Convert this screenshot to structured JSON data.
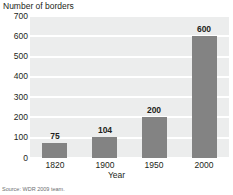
{
  "chart_data": {
    "type": "bar",
    "title": "",
    "ylabel": "Number of borders",
    "xlabel": "Year",
    "categories": [
      "1820",
      "1900",
      "1950",
      "2000"
    ],
    "values": [
      75,
      104,
      200,
      600
    ],
    "data_labels": [
      "75",
      "104",
      "200",
      "600"
    ],
    "ylim": [
      0,
      700
    ],
    "ytick_step": 100,
    "yticks": [
      "700",
      "600",
      "500",
      "400",
      "300",
      "200",
      "100",
      "0"
    ],
    "grid": "horizontal",
    "legend": "none",
    "bar_color": "#838383",
    "plot_background": "#eceded",
    "gridline_color": "#ffffff"
  },
  "source": {
    "note": "Source: WDR 2009 team."
  }
}
